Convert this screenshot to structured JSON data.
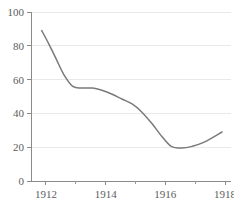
{
  "chart_data": {
    "type": "line",
    "title": "",
    "subtitle": "",
    "xlabel": "",
    "ylabel": "",
    "xlim": [
      1911.5,
      1918.2
    ],
    "ylim": [
      0,
      100
    ],
    "grid": true,
    "legend": null,
    "legend_position": "none",
    "line_color": "#7a7a7a",
    "grid_color": "#e9e9e9",
    "axis_color": "#8a8a8a",
    "label_color": "#5c5c5c",
    "y_ticks": [
      0,
      20,
      40,
      60,
      80,
      100
    ],
    "y_tick_labels": [
      "0",
      "20",
      "40",
      "60",
      "80",
      "100"
    ],
    "x_ticks": [
      1912,
      1913,
      1914,
      1915,
      1916,
      1917,
      1918
    ],
    "x_tick_labels": [
      "1912",
      "",
      "1914",
      "",
      "1916",
      "",
      "1918"
    ],
    "x_major_ticks": [
      1912,
      1914,
      1916,
      1918
    ],
    "x_major_tick_labels": [
      "1912",
      "1914",
      "1916",
      "1918"
    ],
    "series": [
      {
        "name": "series-1",
        "color": "#7a7a7a",
        "x": [
          1911.86,
          1912.1,
          1912.35,
          1912.6,
          1912.9,
          1913.2,
          1913.55,
          1913.9,
          1914.2,
          1914.55,
          1914.9,
          1915.2,
          1915.55,
          1915.9,
          1916.2,
          1916.55,
          1916.9,
          1917.3,
          1917.9
        ],
        "y": [
          89.0,
          81.0,
          72.0,
          63.0,
          56.0,
          55.0,
          55.0,
          53.5,
          51.5,
          48.5,
          45.5,
          41.0,
          34.0,
          26.0,
          20.5,
          19.5,
          20.5,
          23.0,
          29.0
        ]
      }
    ]
  }
}
